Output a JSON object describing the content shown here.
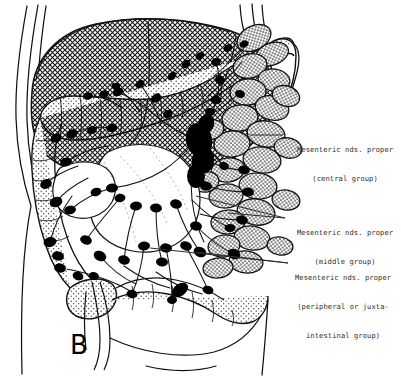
{
  "figure": {
    "panel_letter": "B",
    "background_color": "#ffffff",
    "ink_color": "#000000",
    "text_color": "#2b2b2b"
  },
  "labels": [
    {
      "id": "central",
      "name": "mesenteric-nodes-central",
      "lines": [
        "Mesenteric nds. proper",
        "(central group)"
      ],
      "align": [
        "left",
        "center"
      ],
      "x": 297,
      "y": 126,
      "leader": {
        "x1": 283,
        "y1": 135,
        "x2": 250,
        "y2": 135
      }
    },
    {
      "id": "middle",
      "name": "mesenteric-nodes-middle",
      "lines": [
        "Mesenteric nds. proper",
        "(middle group)"
      ],
      "align": [
        "left",
        "center"
      ],
      "x": 297,
      "y": 209,
      "leader": {
        "x1": 285,
        "y1": 218,
        "x2": 228,
        "y2": 213
      }
    },
    {
      "id": "peripheral",
      "name": "mesenteric-nodes-peripheral",
      "lines": [
        "Mesenteric nds. proper",
        "(peripheral or juxta-",
        "intestinal group)"
      ],
      "align": [
        "left",
        "center",
        "center"
      ],
      "x": 295,
      "y": 254,
      "leader": {
        "x1": 288,
        "y1": 263,
        "x2": 196,
        "y2": 252
      }
    }
  ],
  "anatomy": {
    "structures": [
      "body wall outline",
      "liver (cross-hatched)",
      "transverse colon",
      "ascending colon",
      "descending colon",
      "sigmoid colon",
      "cecum",
      "small bowel loops (stippled)",
      "mesentery",
      "mesenteric vessels",
      "lymph nodes"
    ],
    "textures": {
      "liver": "cross-hatch",
      "small_bowel": "stipple",
      "colon": "fine-stipple-edge"
    }
  }
}
